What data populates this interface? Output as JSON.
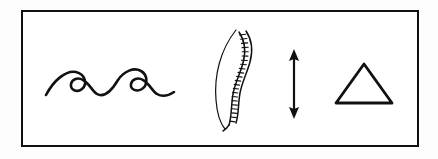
{
  "panel": {
    "width": 438,
    "height": 159,
    "background_color": "#fdfdfd",
    "ink_color": "#111111",
    "description": "Black line-art pictograph panel"
  },
  "frame": {
    "name": "rectangular-border",
    "stroke_color": "#111111",
    "stroke_width": 2,
    "fill_color": "#ffffff",
    "x": 21,
    "y": 10,
    "width": 398,
    "height": 137
  },
  "glyphs": [
    {
      "id": "waves",
      "icon_name": "waves-icon",
      "label": "Three stylized curling waves",
      "stroke_color": "#111111",
      "order": 1,
      "count": 3,
      "x": 44,
      "y": 58,
      "width": 140,
      "height": 48
    },
    {
      "id": "spine",
      "icon_name": "spine-icon",
      "label": "Lateral view of vertebral column",
      "stroke_color": "#111111",
      "order": 2,
      "vertebra_count": 22,
      "x": 206,
      "y": 28,
      "width": 58,
      "height": 104
    },
    {
      "id": "arrow",
      "icon_name": "vertical-double-arrow-icon",
      "label": "Vertical double-headed arrow",
      "stroke_color": "#111111",
      "order": 3,
      "x": 278,
      "y": 48,
      "width": 32,
      "height": 72
    },
    {
      "id": "triangle",
      "icon_name": "triangle-outline-icon",
      "label": "Upward pointing outlined triangle",
      "stroke_color": "#111111",
      "order": 4,
      "x": 330,
      "y": 58,
      "width": 68,
      "height": 52
    }
  ]
}
